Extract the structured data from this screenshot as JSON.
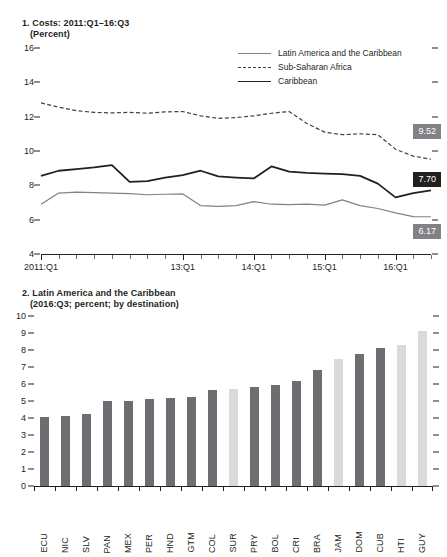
{
  "chart_data": [
    {
      "type": "line",
      "panel_number": "1.",
      "title": "Costs: 2011:Q1–16:Q3",
      "subtitle": "(Percent)",
      "xlabel": "",
      "ylabel": "",
      "ylim": [
        4,
        16
      ],
      "yticks": [
        4,
        6,
        8,
        10,
        12,
        14,
        16
      ],
      "grid": false,
      "legend_position": "top-right",
      "x": [
        "2011:Q1",
        "2011:Q2",
        "2011:Q3",
        "2011:Q4",
        "2012:Q1",
        "2012:Q2",
        "2012:Q3",
        "2012:Q4",
        "2013:Q1",
        "2013:Q2",
        "2013:Q3",
        "2013:Q4",
        "2014:Q1",
        "2014:Q2",
        "2014:Q3",
        "2014:Q4",
        "2015:Q1",
        "2015:Q2",
        "2015:Q3",
        "2015:Q4",
        "2016:Q1",
        "2016:Q2",
        "2016:Q3"
      ],
      "xtick_labels": [
        "2011:Q1",
        "13:Q1",
        "14:Q1",
        "15:Q1",
        "16:Q1"
      ],
      "xtick_indices": [
        0,
        8,
        12,
        16,
        20
      ],
      "series": [
        {
          "name": "Latin America and the Caribbean",
          "style": "solid-thin",
          "color": "#808285",
          "values": [
            6.9,
            7.55,
            7.6,
            7.58,
            7.55,
            7.52,
            7.45,
            7.48,
            7.5,
            6.82,
            6.78,
            6.82,
            7.05,
            6.9,
            6.88,
            6.9,
            6.85,
            7.15,
            6.82,
            6.65,
            6.4,
            6.18,
            6.17
          ],
          "end_label": "6.17"
        },
        {
          "name": "Sub-Saharan Africa",
          "style": "dashed",
          "color": "#414042",
          "values": [
            12.8,
            12.55,
            12.35,
            12.25,
            12.22,
            12.25,
            12.2,
            12.28,
            12.3,
            12.05,
            11.9,
            11.95,
            12.05,
            12.2,
            12.3,
            11.6,
            11.1,
            10.95,
            11.0,
            10.95,
            10.1,
            9.7,
            9.52
          ],
          "end_label": "9.52"
        },
        {
          "name": "Caribbean",
          "style": "solid-thick",
          "color": "#231f20",
          "values": [
            8.55,
            8.85,
            8.95,
            9.05,
            9.18,
            8.2,
            8.25,
            8.45,
            8.6,
            8.85,
            8.52,
            8.45,
            8.4,
            9.1,
            8.8,
            8.72,
            8.68,
            8.65,
            8.55,
            8.1,
            7.3,
            7.55,
            7.7
          ],
          "end_label": "7.70"
        }
      ]
    },
    {
      "type": "bar",
      "panel_number": "2.",
      "title": "Latin America and the Caribbean",
      "subtitle": "(2016:Q3; percent; by destination)",
      "xlabel": "",
      "ylabel": "",
      "ylim": [
        0,
        10
      ],
      "yticks": [
        0,
        1,
        2,
        3,
        4,
        5,
        6,
        7,
        8,
        9,
        10
      ],
      "grid": false,
      "categories": [
        "ECU",
        "NIC",
        "SLV",
        "PAN",
        "MEX",
        "PER",
        "HND",
        "GTM",
        "COL",
        "SUR",
        "PRY",
        "BOL",
        "CRI",
        "BRA",
        "JAM",
        "DOM",
        "CUB",
        "HTI",
        "GUY"
      ],
      "values": [
        4.05,
        4.1,
        4.22,
        5.0,
        5.02,
        5.1,
        5.2,
        5.22,
        5.65,
        5.7,
        5.85,
        5.95,
        6.15,
        6.85,
        7.45,
        7.75,
        8.1,
        8.3,
        9.1
      ],
      "bar_colors": [
        "#6d6e71",
        "#6d6e71",
        "#6d6e71",
        "#6d6e71",
        "#6d6e71",
        "#6d6e71",
        "#6d6e71",
        "#6d6e71",
        "#6d6e71",
        "#d9dada",
        "#6d6e71",
        "#6d6e71",
        "#6d6e71",
        "#6d6e71",
        "#d9dada",
        "#6d6e71",
        "#6d6e71",
        "#d9dada",
        "#d9dada"
      ]
    }
  ],
  "colors": {
    "dark_bar": "#6d6e71",
    "light_bar": "#d9dada",
    "axis": "#231f20",
    "value_box_dark": "#231f20",
    "value_box_grey": "#808285"
  }
}
